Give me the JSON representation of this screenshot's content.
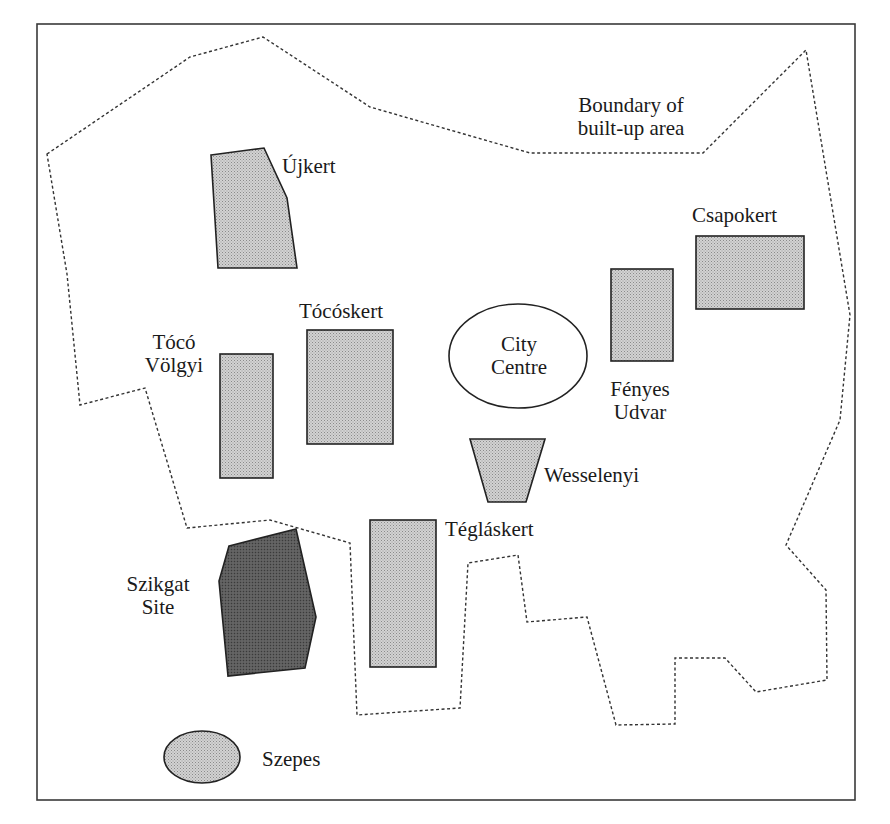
{
  "figure": {
    "frame": {
      "x": 37,
      "y": 24,
      "width": 818,
      "height": 776,
      "stroke": "#3a3a3a"
    },
    "colors": {
      "estate_fill": "#c4c4c4",
      "site_fill": "#5a5a5a",
      "outline": "#222222",
      "boundary": "#333333",
      "background": "#ffffff"
    }
  },
  "boundary": {
    "label_line1": "Boundary of",
    "label_line2": "built-up area",
    "points": "47,154 190,57 263,37 370,107 530,153 703,153 806,50 850,315 840,420 786,545 826,590 827,680 756,692 725,658 675,658 675,724 616,725 587,617 527,622 518,555 468,563 460,708 357,715 350,543 270,520 187,528 145,388 80,405 67,274"
  },
  "areas": {
    "ujkert": {
      "name": "Újkert",
      "type": "estate"
    },
    "toco_volgyi": {
      "name_line1": "Tócó",
      "name_line2": "Völgyi",
      "type": "estate"
    },
    "tocoskert": {
      "name": "Tócóskert",
      "type": "estate"
    },
    "city_centre": {
      "name_line1": "City",
      "name_line2": "Centre",
      "type": "centre"
    },
    "fenyes_udvar": {
      "name_line1": "Fényes",
      "name_line2": "Udvar",
      "type": "estate"
    },
    "csapokert": {
      "name": "Csapokert",
      "type": "estate"
    },
    "wesselenyi": {
      "name": "Wesselenyi",
      "type": "estate"
    },
    "teglaskert": {
      "name": "Tégláskert",
      "type": "estate"
    },
    "szikgat": {
      "name_line1": "Szikgat",
      "name_line2": "Site",
      "type": "site"
    },
    "szepes": {
      "name": "Szepes",
      "type": "estate"
    }
  }
}
